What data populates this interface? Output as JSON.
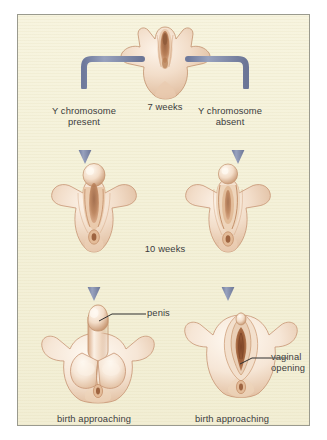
{
  "figure": {
    "panel": {
      "background_color": "#f4f1d9",
      "border_color": "#9a9a8e"
    },
    "arrow_color": "#7b86a6",
    "leader_line_color": "#2f2f2f",
    "text_color": "#3b3b3b"
  },
  "stages": {
    "indifferent": {
      "caption": "7 weeks",
      "icon": "indifferent-genitalia-icon"
    },
    "ten_weeks": {
      "caption": "10 weeks",
      "male_icon": "male-10-weeks-icon",
      "female_icon": "female-10-weeks-icon"
    },
    "birth": {
      "male_caption": "birth approaching",
      "female_caption": "birth approaching",
      "male_icon": "male-birth-icon",
      "female_icon": "female-birth-icon"
    }
  },
  "branches": {
    "male": {
      "condition_line1": "Y chromosome",
      "condition_line2": "present",
      "elbow_arrow_icon": "elbow-arrow-left-icon",
      "down_arrow_icon": "down-arrow-icon"
    },
    "female": {
      "condition_line1": "Y chromosome",
      "condition_line2": "absent",
      "elbow_arrow_icon": "elbow-arrow-right-icon",
      "down_arrow_icon": "down-arrow-icon"
    }
  },
  "callouts": {
    "penis": {
      "label": "penis",
      "leader_icon": "leader-line-icon"
    },
    "vaginal_opening": {
      "label_line1": "vaginal",
      "label_line2": "opening",
      "leader_icon": "leader-line-icon"
    }
  }
}
